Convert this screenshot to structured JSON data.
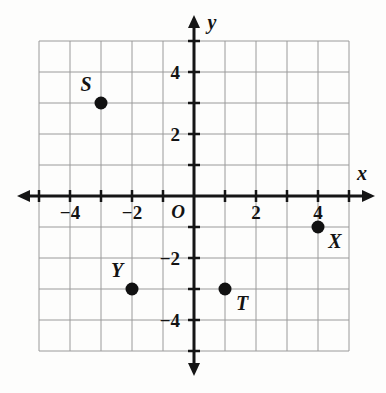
{
  "figure": {
    "type": "coordinate-plane",
    "background_color": "#fdfdfc",
    "grid_color": "#9a9a9a",
    "axis_color": "#151515",
    "point_color": "#111111"
  },
  "axes": {
    "x_label": "x",
    "y_label": "y",
    "origin_label": "O",
    "x_range": [
      -5,
      5
    ],
    "y_range": [
      -5,
      5
    ],
    "grid": true,
    "x_tick_labels": [
      {
        "value": -4,
        "text": "−4"
      },
      {
        "value": -2,
        "text": "−2"
      },
      {
        "value": 2,
        "text": "2"
      },
      {
        "value": 4,
        "text": "4"
      }
    ],
    "y_tick_labels": [
      {
        "value": 4,
        "text": "4"
      },
      {
        "value": 2,
        "text": "2"
      },
      {
        "value": -2,
        "text": "−2"
      },
      {
        "value": -4,
        "text": "−4"
      }
    ]
  },
  "chart_data": {
    "type": "scatter",
    "title": "",
    "xlabel": "x",
    "ylabel": "y",
    "xlim": [
      -5,
      5
    ],
    "ylim": [
      -5,
      5
    ],
    "grid": true,
    "legend": "none",
    "points": [
      {
        "label": "S",
        "x": -3,
        "y": 3,
        "label_position": "above-left"
      },
      {
        "label": "X",
        "x": 4,
        "y": -1,
        "label_position": "below-right"
      },
      {
        "label": "Y",
        "x": -2,
        "y": -3,
        "label_position": "above-left"
      },
      {
        "label": "T",
        "x": 1,
        "y": -3,
        "label_position": "below-right"
      }
    ]
  }
}
